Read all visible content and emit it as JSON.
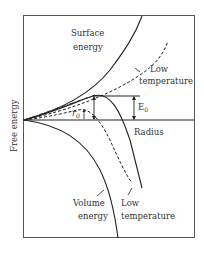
{
  "diagram": {
    "type": "nucleation free energy vs radius",
    "y_axis_label": "Free energy",
    "x_axis_label": "Radius",
    "curves": [
      {
        "name": "Surface energy",
        "style": "solid",
        "label_lines": [
          "Surface",
          "energy"
        ]
      },
      {
        "name": "Surface energy (low temperature)",
        "style": "dashed",
        "label_lines": [
          "Low",
          "temperature"
        ]
      },
      {
        "name": "Volume energy",
        "style": "solid",
        "label_lines": [
          "Volume",
          "energy"
        ]
      },
      {
        "name": "Volume energy (low temperature)",
        "style": "dashed",
        "label_lines": [
          "Low",
          "temperature"
        ]
      },
      {
        "name": "Total free energy",
        "style": "solid"
      },
      {
        "name": "Total free energy (low temperature)",
        "style": "dashed"
      }
    ],
    "annotations": {
      "barrier": {
        "symbol": "E",
        "subscript": "0"
      },
      "critical_radius": {
        "symbol": "r",
        "subscript": "0"
      }
    },
    "colors": {
      "line": "#222222",
      "text": "#333333",
      "background": "#ffffff"
    }
  }
}
